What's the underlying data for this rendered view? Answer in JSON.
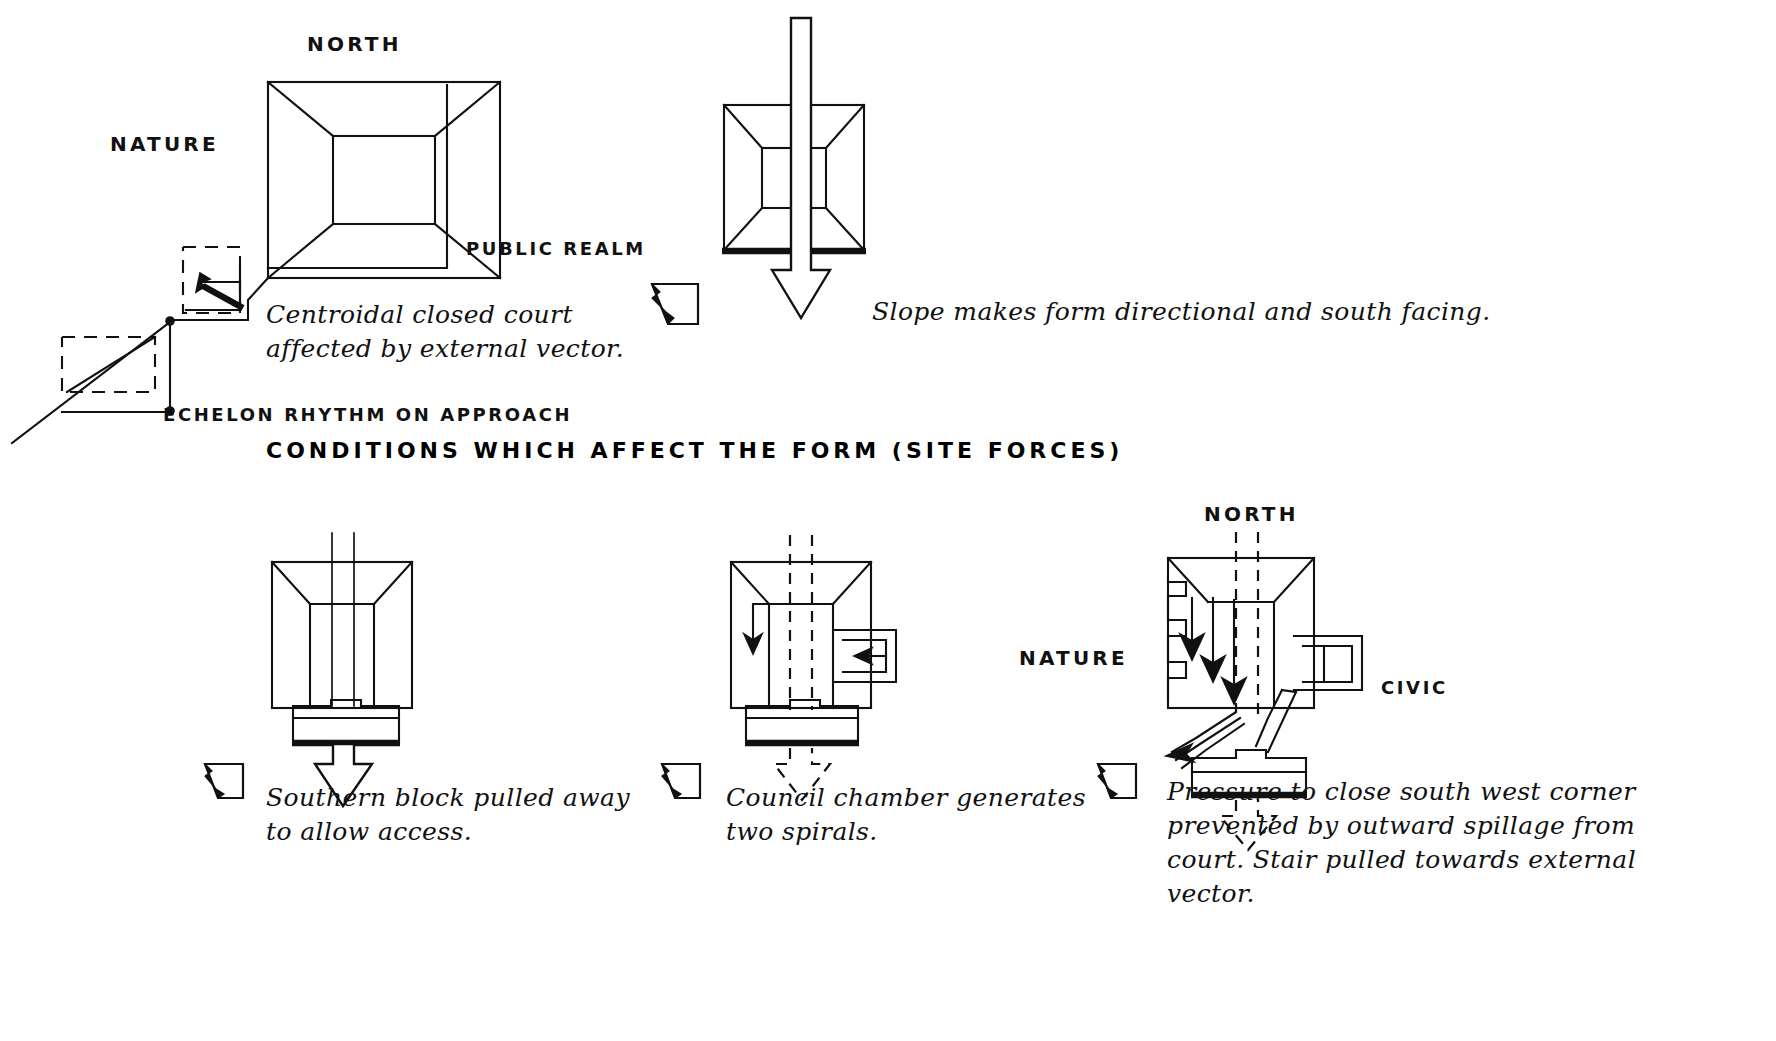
{
  "sheet": {
    "title": "CONDITIONS  WHICH  AFFECT  THE  FORM  (SITE FORCES)",
    "background_color": "#ffffff",
    "ink_color": "#111111"
  },
  "panels": [
    {
      "id": "panel-1",
      "position": "top-left",
      "labels": {
        "north": "NORTH",
        "nature": "NATURE",
        "public_realm": "PUBLIC REALM",
        "echelon": "ECHELON RHYTHM ON APPROACH"
      },
      "caption_line_1": "Centroidal closed court",
      "caption_line_2": "affected by external vector.",
      "annotations": [
        "centroidal-court",
        "external-vector-arrow",
        "echelon-dashed-steps"
      ]
    },
    {
      "id": "panel-2",
      "position": "top-right",
      "caption_line_1": "Slope makes form directional and south facing.",
      "annotations": [
        "hollow-through-arrow",
        "thick-south-edge"
      ]
    },
    {
      "id": "panel-3",
      "position": "bottom-left",
      "caption_line_1": "Southern block pulled away",
      "caption_line_2": "to allow access.",
      "annotations": [
        "southern-block",
        "hollow-down-arrow"
      ]
    },
    {
      "id": "panel-4",
      "position": "bottom-middle",
      "caption_line_1": "Council chamber generates",
      "caption_line_2": "two spirals.",
      "annotations": [
        "spiral-hook-left",
        "spiral-hook-right",
        "dashed-axis",
        "dashed-out-arrow"
      ]
    },
    {
      "id": "panel-5",
      "position": "bottom-right",
      "labels": {
        "north": "NORTH",
        "nature": "NATURE",
        "civic": "CIVIC"
      },
      "caption_line_1": "Pressure to close south west corner",
      "caption_line_2": "prevented by outward spillage from",
      "caption_line_3": "court. Stair pulled towards external",
      "caption_line_4": "vector.",
      "annotations": [
        "triple-pressure-arrows",
        "spillage-arrow",
        "stair-pull",
        "dashed-out-arrow"
      ]
    }
  ],
  "icons": {
    "site_marker": "site-plan-marker-icon",
    "north_arrow": "north-indicator-icon"
  }
}
